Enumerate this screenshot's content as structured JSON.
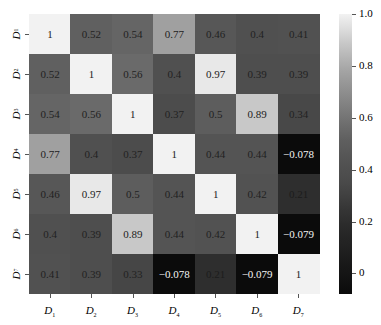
{
  "chart_data": {
    "type": "heatmap",
    "title": "",
    "xlabel": "",
    "ylabel": "",
    "x_labels": [
      {
        "base": "D",
        "sub": "1"
      },
      {
        "base": "D",
        "sub": "2"
      },
      {
        "base": "D",
        "sub": "3"
      },
      {
        "base": "D",
        "sub": "4"
      },
      {
        "base": "D",
        "sub": "5"
      },
      {
        "base": "D",
        "sub": "6"
      },
      {
        "base": "D",
        "sub": "7"
      }
    ],
    "y_labels": [
      {
        "base": "D",
        "sub": "1"
      },
      {
        "base": "D",
        "sub": "2"
      },
      {
        "base": "D",
        "sub": "3"
      },
      {
        "base": "D",
        "sub": "4"
      },
      {
        "base": "D",
        "sub": "5"
      },
      {
        "base": "D",
        "sub": "6"
      },
      {
        "base": "D",
        "sub": "7"
      }
    ],
    "matrix": [
      [
        "1",
        "0.52",
        "0.54",
        "0.77",
        "0.46",
        "0.4",
        "0.41"
      ],
      [
        "0.52",
        "1",
        "0.56",
        "0.4",
        "0.97",
        "0.39",
        "0.39"
      ],
      [
        "0.54",
        "0.56",
        "1",
        "0.37",
        "0.5",
        "0.89",
        "0.34"
      ],
      [
        "0.77",
        "0.4",
        "0.37",
        "1",
        "0.44",
        "0.44",
        "-0.078"
      ],
      [
        "0.46",
        "0.97",
        "0.5",
        "0.44",
        "1",
        "0.42",
        "0.21"
      ],
      [
        "0.4",
        "0.39",
        "0.89",
        "0.44",
        "0.42",
        "1",
        "-0.079"
      ],
      [
        "0.41",
        "0.39",
        "0.33",
        "-0.078",
        "0.21",
        "-0.079",
        "1"
      ]
    ],
    "colormap": "greys (black = low, white = high)",
    "colorbar": {
      "range": [
        -0.079,
        1.0
      ],
      "ticks": [
        "1.0",
        "0.8",
        "0.6",
        "0.4",
        "0.2",
        "0"
      ],
      "tick_values": [
        1.0,
        0.8,
        0.6,
        0.4,
        0.2,
        0.0
      ]
    },
    "color_anchors": [
      [
        -0.079,
        "#0b0b0b"
      ],
      [
        0.21,
        "#2e2e2e"
      ],
      [
        0.35,
        "#4a4a4a"
      ],
      [
        0.45,
        "#555555"
      ],
      [
        0.52,
        "#606060"
      ],
      [
        0.77,
        "#a0a0a0"
      ],
      [
        0.89,
        "#c8c8c8"
      ],
      [
        0.97,
        "#e8e8e8"
      ],
      [
        1.0,
        "#f2f2f2"
      ]
    ]
  }
}
